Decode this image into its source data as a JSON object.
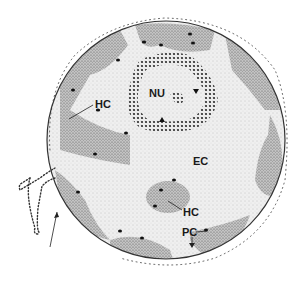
{
  "diagram": {
    "type": "cell-nucleus-schematic",
    "colors": {
      "background": "#ffffff",
      "euchromatin": "#e6e6e6",
      "heterochromatin": "#a8a8a8",
      "nucleolus_granules": "#2a2a2a",
      "envelope": "#333333",
      "ink": "#1a1a1a"
    },
    "labels": {
      "nucleolus": "NU",
      "heterochromatin_upper": "HC",
      "heterochromatin_lower": "HC",
      "euchromatin": "EC",
      "perichromatin": "PC"
    },
    "annotations": {
      "nucleolus_arrowheads": 2,
      "er_arrow": "arrow pointing to nuclear envelope continuous with ER"
    }
  }
}
